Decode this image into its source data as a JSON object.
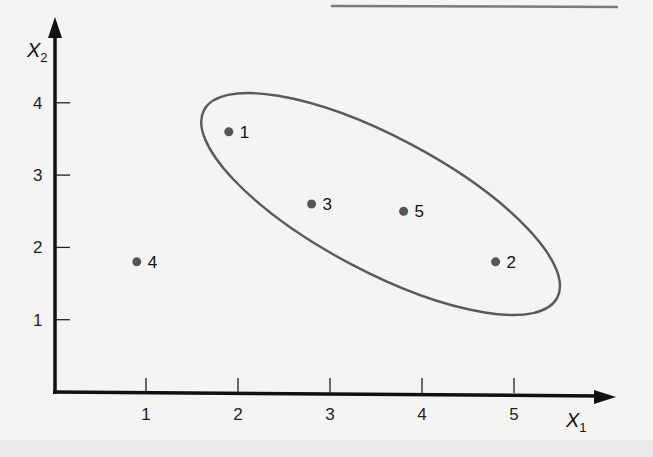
{
  "chart_data": {
    "type": "scatter",
    "title": "",
    "xlabel": "X",
    "xlabel_subscript": "1",
    "ylabel": "X",
    "ylabel_subscript": "2",
    "xlim": [
      0,
      6
    ],
    "ylim": [
      0,
      5
    ],
    "grid": false,
    "x_ticks": [
      1,
      2,
      3,
      4,
      5
    ],
    "y_ticks": [
      1,
      2,
      3,
      4
    ],
    "points": [
      {
        "label": "1",
        "x": 1.9,
        "y": 3.6
      },
      {
        "label": "2",
        "x": 4.8,
        "y": 1.8
      },
      {
        "label": "3",
        "x": 2.8,
        "y": 2.6
      },
      {
        "label": "4",
        "x": 0.9,
        "y": 1.8
      },
      {
        "label": "5",
        "x": 3.8,
        "y": 2.5
      }
    ],
    "annotations": [
      {
        "type": "ellipse",
        "encloses": [
          "1",
          "3",
          "5",
          "2"
        ],
        "center": [
          3.55,
          2.6
        ],
        "angle_deg": -28
      }
    ]
  },
  "colors": {
    "axis": "#111111",
    "point": "#555555",
    "ellipse": "#5a5a5a",
    "top_rule": "#7a7a7a"
  }
}
